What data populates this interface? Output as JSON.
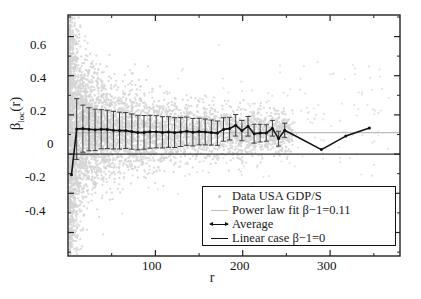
{
  "chart_data": {
    "type": "scatter",
    "title": "",
    "xlabel": "r",
    "ylabel": "βloc(r)",
    "xlim": [
      0,
      380
    ],
    "ylim": [
      -0.52,
      0.71
    ],
    "xticks": [
      100,
      200,
      300
    ],
    "yticks": [
      -0.4,
      -0.2,
      0,
      0.2,
      0.4,
      0.6
    ],
    "xtick_labels": [
      "100",
      "200",
      "300"
    ],
    "ytick_labels": [
      "-0.4",
      "-0.2",
      "0",
      "0.2",
      "0.4",
      "0.6"
    ],
    "grid": false,
    "legend_position": "lower right",
    "reference_lines": [
      {
        "name": "power-law-fit",
        "y": 0.11,
        "color": "#bdbdbd",
        "label": "Power law fit β−1=0.11"
      },
      {
        "name": "linear-case",
        "y": 0.0,
        "color": "#333333",
        "label": "Linear case β−1=0"
      }
    ],
    "series": [
      {
        "name": "Data USA GDP/S",
        "type": "scatter",
        "color": "#d0d0d0",
        "marker": "dot",
        "note": "dense grey point cloud, widest spread at small r, funnelling toward 0.11 for large r"
      },
      {
        "name": "Average",
        "type": "line-errorbar",
        "color": "#111111",
        "x": [
          4,
          10,
          17,
          24,
          31,
          38,
          45,
          52,
          59,
          66,
          73,
          80,
          87,
          94,
          101,
          108,
          115,
          122,
          129,
          136,
          143,
          150,
          157,
          164,
          171,
          178,
          185,
          192,
          199,
          206,
          213,
          220,
          227,
          234,
          241,
          248,
          290,
          318,
          345
        ],
        "y": [
          -0.105,
          0.128,
          0.13,
          0.127,
          0.124,
          0.127,
          0.126,
          0.122,
          0.12,
          0.12,
          0.115,
          0.11,
          0.111,
          0.114,
          0.114,
          0.111,
          0.113,
          0.11,
          0.113,
          0.117,
          0.112,
          0.115,
          0.113,
          0.11,
          0.107,
          0.126,
          0.13,
          0.147,
          0.12,
          0.142,
          0.104,
          0.107,
          0.108,
          0.132,
          0.079,
          0.122,
          0.023,
          0.092,
          0.133
        ],
        "yerr": [
          0.0,
          0.155,
          0.12,
          0.11,
          0.105,
          0.1,
          0.098,
          0.096,
          0.094,
          0.092,
          0.09,
          0.088,
          0.086,
          0.084,
          0.082,
          0.08,
          0.078,
          0.076,
          0.074,
          0.072,
          0.07,
          0.068,
          0.066,
          0.064,
          0.062,
          0.06,
          0.058,
          0.055,
          0.052,
          0.05,
          0.048,
          0.045,
          0.042,
          0.04,
          0.038,
          0.036,
          0.0,
          0.0,
          0.0
        ]
      }
    ]
  },
  "axes": {
    "ylabel_beta": "β",
    "ylabel_sub": "loc",
    "ylabel_arg": "(r)",
    "xlabel": "r"
  },
  "legend": {
    "items": [
      {
        "key": "dot",
        "label": "Data USA GDP/S"
      },
      {
        "key": "grey-line",
        "label": "Power law fit β−1=0.11"
      },
      {
        "key": "avg-line",
        "label": "Average"
      },
      {
        "key": "dark-line",
        "label": "Linear case β−1=0"
      }
    ]
  }
}
